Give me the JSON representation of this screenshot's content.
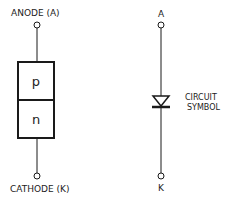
{
  "left_diagram": {
    "top_label": "ANODE (A)",
    "bottom_label": "CATHODE (K)",
    "p_region_label": "p",
    "n_region_label": "n"
  },
  "right_diagram": {
    "top_label": "A",
    "bottom_label": "K",
    "caption_line1": "CIRCUIT",
    "caption_line2": "SYMBOL"
  },
  "colors": {
    "ink": "#1a1a1a",
    "background": "#ffffff"
  }
}
